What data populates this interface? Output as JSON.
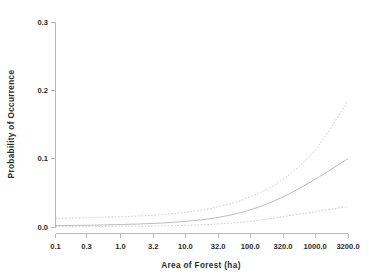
{
  "chart_data": {
    "type": "line",
    "title": "",
    "xlabel": "Area of Forest (ha)",
    "ylabel": "Probability of Occurrence",
    "xscale": "log",
    "xlim": [
      0.1,
      3200.0
    ],
    "ylim": [
      0.0,
      0.3
    ],
    "grid": false,
    "legend": null,
    "xticks": [
      0.1,
      0.3,
      1.0,
      3.2,
      10.0,
      32.0,
      100.0,
      320.0,
      1000.0,
      3200.0
    ],
    "xticklabels": [
      "0.1",
      "0.3",
      "1.0",
      "3.2",
      "10.0",
      "32.0",
      "100.0",
      "320.0",
      "1000.0",
      "3200.0"
    ],
    "yticks": [
      0.0,
      0.1,
      0.2,
      0.3
    ],
    "yticklabels": [
      "0.0",
      "0.1",
      "0.2",
      "0.3"
    ],
    "x": [
      0.1,
      0.3,
      1.0,
      3.2,
      10.0,
      32.0,
      100.0,
      320.0,
      1000.0,
      3200.0
    ],
    "series": [
      {
        "name": "Upper 95% confidence limit",
        "style": "dashed",
        "color": "#c2c2c2",
        "values": [
          0.0125,
          0.0135,
          0.015,
          0.0172,
          0.0215,
          0.0295,
          0.044,
          0.07,
          0.113,
          0.185
        ]
      },
      {
        "name": "Fitted probability of occurrence",
        "style": "solid",
        "color": "#b4b4b4",
        "values": [
          0.002,
          0.0026,
          0.0036,
          0.0052,
          0.0082,
          0.014,
          0.025,
          0.044,
          0.07,
          0.1
        ]
      },
      {
        "name": "Lower 95% confidence limit",
        "style": "dashed",
        "color": "#c2c2c2",
        "values": [
          0.0004,
          0.0006,
          0.0009,
          0.0014,
          0.0024,
          0.0044,
          0.0083,
          0.015,
          0.0225,
          0.03
        ]
      }
    ]
  },
  "axes": {
    "x_title": "Area of Forest (ha)",
    "y_title": "Probability of Occurrence"
  }
}
